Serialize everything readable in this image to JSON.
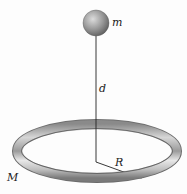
{
  "diagram": {
    "type": "physics-figure",
    "labels": {
      "point_mass": "m",
      "distance": "d",
      "ring_radius": "R",
      "ring_mass": "M"
    },
    "elements": [
      {
        "id": "sphere",
        "kind": "sphere",
        "label": "m"
      },
      {
        "id": "axis-line",
        "kind": "line",
        "label": "d",
        "from": "sphere",
        "to": "ring-center"
      },
      {
        "id": "ring",
        "kind": "torus",
        "label": "M"
      },
      {
        "id": "radius-arrow",
        "kind": "arrow",
        "label": "R",
        "from": "ring-center",
        "to": "ring-edge"
      }
    ],
    "colors": {
      "sphere_light": "#d8d8d8",
      "sphere_dark": "#6a6a6a",
      "ring_light": "#e6e6e6",
      "ring_dark": "#7a7a7a",
      "line": "#222222",
      "background": "#fdfdfd"
    }
  }
}
